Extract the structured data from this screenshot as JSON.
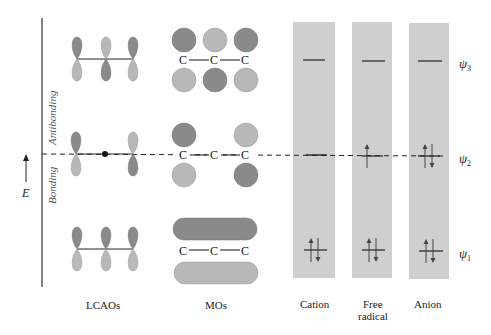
{
  "axis": {
    "energy_label": "E",
    "antibonding_label": "Antibonding",
    "bonding_label": "Bonding"
  },
  "columns": {
    "lcaos": "LCAOs",
    "mos": "MOs",
    "cation": "Cation",
    "free_radical_line1": "Free",
    "free_radical_line2": "radical",
    "anion": "Anion"
  },
  "atoms": {
    "carbon": "C"
  },
  "levels": [
    {
      "name": "ψ",
      "sub": "3",
      "cation_electrons": 0,
      "radical_electrons": 0,
      "anion_electrons": 0
    },
    {
      "name": "ψ",
      "sub": "2",
      "cation_electrons": 0,
      "radical_electrons": 1,
      "anion_electrons": 2
    },
    {
      "name": "ψ",
      "sub": "1",
      "cation_electrons": 2,
      "radical_electrons": 2,
      "anion_electrons": 2
    }
  ],
  "colors": {
    "dark_lobe": "#8a8a8a",
    "light_lobe": "#b8b8b8",
    "panel": "#cfcfcf",
    "line": "#222222"
  }
}
